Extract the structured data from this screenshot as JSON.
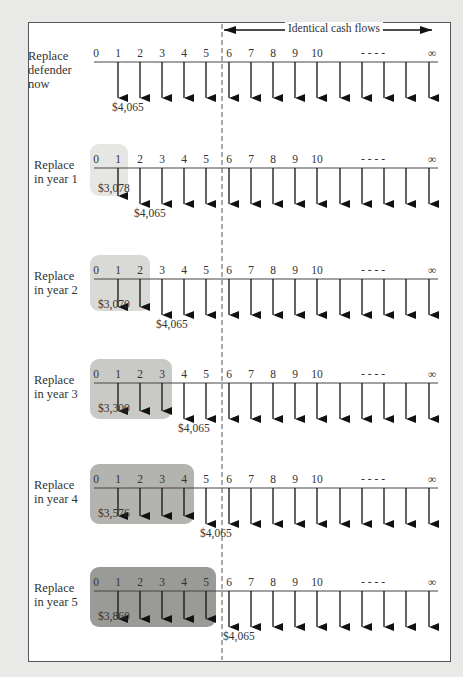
{
  "header": {
    "banner_label": "Identical cash flows",
    "boundary_year": 5.5
  },
  "timeline": {
    "tick_labels": [
      "0",
      "1",
      "2",
      "3",
      "4",
      "5",
      "6",
      "7",
      "8",
      "9",
      "10",
      "- - - -",
      "∞"
    ],
    "continuation": "- - - -",
    "infinity": "∞"
  },
  "colors": {
    "background": "#e9e9e7",
    "frame": "#ffffff",
    "box_shades": [
      "#e6e6e4",
      "#d9d9d6",
      "#c9c9c6",
      "#b3b3b0",
      "#9a9a97"
    ]
  },
  "rows": [
    {
      "label_lines": [
        "Replace",
        "defender",
        "now"
      ],
      "label": "Replace defender now",
      "replace_year": 0,
      "defender_amount": null,
      "challenger_amount": "$4,065"
    },
    {
      "label_lines": [
        "Replace",
        "in year 1"
      ],
      "label": "Replace in year 1",
      "replace_year": 1,
      "defender_amount": "$3,078",
      "challenger_amount": "$4,065"
    },
    {
      "label_lines": [
        "Replace",
        "in year 2"
      ],
      "label": "Replace in year 2",
      "replace_year": 2,
      "defender_amount": "$3,070",
      "challenger_amount": "$4,065"
    },
    {
      "label_lines": [
        "Replace",
        "in year 3"
      ],
      "label": "Replace in year 3",
      "replace_year": 3,
      "defender_amount": "$3,300",
      "challenger_amount": "$4,065"
    },
    {
      "label_lines": [
        "Replace",
        "in year 4"
      ],
      "label": "Replace in year 4",
      "replace_year": 4,
      "defender_amount": "$3,576",
      "challenger_amount": "$4,065"
    },
    {
      "label_lines": [
        "Replace",
        "in year 5"
      ],
      "label": "Replace in year 5",
      "replace_year": 5,
      "defender_amount": "$3,860",
      "challenger_amount": "$4,065"
    }
  ]
}
